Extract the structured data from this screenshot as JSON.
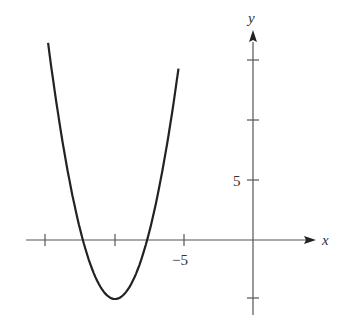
{
  "chart_data": {
    "type": "line",
    "title": "",
    "xlabel": "x",
    "ylabel": "y",
    "xlim": [
      -18.3,
      5.5
    ],
    "ylim": [
      -6.3,
      17.5
    ],
    "grid": false,
    "x_ticks": [
      -15,
      -10,
      -5
    ],
    "x_tick_labels": {
      "-5": "−5"
    },
    "y_ticks": [
      -5,
      5,
      10,
      15
    ],
    "y_tick_labels": {
      "5": "5"
    },
    "series": [
      {
        "name": "parabola",
        "equation_estimate": "y = (x + 10)^2 - 5",
        "vertex": [
          -10,
          -5
        ],
        "roots_approx": [
          -12.3,
          -7.7
        ],
        "x": [
          -14.85,
          -14,
          -13,
          -12.3,
          -12,
          -11,
          -10,
          -9,
          -8,
          -7.7,
          -7,
          -6,
          -5.4
        ],
        "y": [
          16.7,
          11.0,
          4.0,
          0.0,
          -1.0,
          -4.0,
          -5.0,
          -4.0,
          -1.0,
          0.0,
          4.0,
          11.0,
          16.7
        ]
      }
    ]
  },
  "labels": {
    "x_axis": "x",
    "y_axis": "y",
    "x_tick_neg5": "−5",
    "y_tick_5": "5"
  },
  "colors": {
    "axis": "#555555",
    "curve": "#222222"
  }
}
